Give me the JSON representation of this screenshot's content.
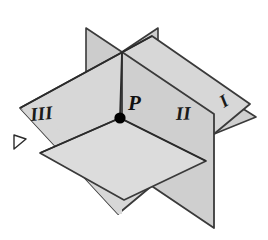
{
  "figure": {
    "background_color": "#ffffff",
    "point": {
      "name": "P",
      "label": "P",
      "x": 120,
      "y": 118,
      "radius": 5.5,
      "color": "#000000"
    },
    "labels": {
      "plane_one": "I",
      "plane_two": "II",
      "plane_three": "III"
    },
    "colors": {
      "plane_back_vertical": "#d2d2d2",
      "plane_front_vertical": "#cfcfcf",
      "plane_large_vertical": "#d6d6d6",
      "plane_right_wing": "#d0d0d0",
      "plane_horizontal": "#d9d9d9",
      "outline": "#3a3a3a",
      "outline_dark": "#2b2b2b",
      "label_color": "#1a1a1a",
      "point_color": "#000000"
    },
    "geometry": {
      "left_vertical_plane": "18,110 150,38 250,104 118,215",
      "back_blade": "92,33 122,52 152,33",
      "front_blade_left": "92,33 122,52 122,118",
      "front_blade_right": "152,33 122,52 122,118",
      "right_wing": "152,45 252,107 212,128",
      "second_vertical_plane": "122,52 212,112 212,222 122,162",
      "horizontal_plane": "38,152 120,118 205,160 122,200",
      "left_notch": "16,136 26,140 16,148"
    }
  }
}
